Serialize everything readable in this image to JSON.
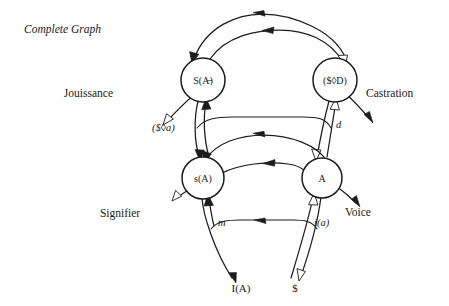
{
  "figure": {
    "title": "Complete Graph",
    "background_color": "#ffffff",
    "ink_color": "#1c1c1c"
  },
  "nodes": [
    {
      "id": "S-barred-A",
      "label_prefix": "S(",
      "label_core": "A",
      "label_suffix": ")",
      "barred": true,
      "display": "S(A̶)",
      "x": 203,
      "y": 80,
      "r": 22
    },
    {
      "id": "barred-S-lozenge-D",
      "display": "($◊D)",
      "x": 335,
      "y": 80,
      "r": 22
    },
    {
      "id": "s-A",
      "display": "s(A)",
      "x": 203,
      "y": 178,
      "r": 21
    },
    {
      "id": "A",
      "display": "A",
      "x": 322,
      "y": 178,
      "r": 20
    }
  ],
  "edge_labels": [
    {
      "id": "fantasy-matheme",
      "text": "($◊a)",
      "x": 152,
      "y": 131
    },
    {
      "id": "demand-d",
      "text": "d",
      "x": 336,
      "y": 128
    },
    {
      "id": "moi-m",
      "text": "m",
      "x": 218,
      "y": 226
    },
    {
      "id": "imaginary-i-a",
      "text": "i(a)",
      "x": 314,
      "y": 226
    }
  ],
  "outer_labels": [
    {
      "id": "jouissance",
      "text": "Jouissance",
      "x": 113,
      "y": 97
    },
    {
      "id": "castration",
      "text": "Castration",
      "x": 366,
      "y": 97
    },
    {
      "id": "signifier",
      "text": "Signifier",
      "x": 120,
      "y": 217
    },
    {
      "id": "voice",
      "text": "Voice",
      "x": 345,
      "y": 216
    }
  ],
  "terminals": [
    {
      "id": "ideal-ego-I-A",
      "text": "I(A)",
      "x": 241,
      "y": 292
    },
    {
      "id": "barred-subject",
      "text": "$",
      "x": 295,
      "y": 292
    }
  ]
}
